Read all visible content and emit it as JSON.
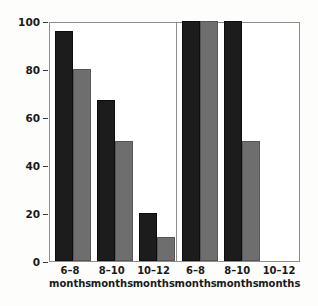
{
  "chart_data": {
    "type": "bar",
    "title": "",
    "subtitle": "",
    "xlabel": "",
    "ylabel": "Infants able to discriminate (%)",
    "ylim": [
      0,
      100
    ],
    "yticks": [
      0,
      20,
      40,
      60,
      80,
      100
    ],
    "ytick_labels": [
      "0",
      "20",
      "40",
      "60",
      "80",
      "100"
    ],
    "grid": false,
    "legend": "none",
    "panels": [
      {
        "name": "left-panel",
        "categories": [
          "6–8 months",
          "8–10 months",
          "10–12 months"
        ],
        "series": [
          {
            "name": "dark-series",
            "color": "#1c1c1c",
            "values": [
              96,
              67,
              20
            ]
          },
          {
            "name": "gray-series",
            "color": "#6e6e6e",
            "values": [
              80,
              50,
              10
            ]
          }
        ]
      },
      {
        "name": "right-panel",
        "categories": [
          "6–8 months",
          "8–10 months",
          "10–12 months"
        ],
        "series": [
          {
            "name": "dark-series",
            "color": "#1c1c1c",
            "values": [
              100,
              100,
              0
            ]
          },
          {
            "name": "gray-series",
            "color": "#6e6e6e",
            "values": [
              100,
              50,
              0
            ]
          }
        ]
      }
    ]
  },
  "axis": {
    "y_title": "Infants able to discriminate (%)",
    "y_tick_labels": [
      "100",
      "80",
      "60",
      "40",
      "20",
      "0"
    ]
  },
  "x_categories": [
    {
      "line1": "6–8",
      "line2": "months"
    },
    {
      "line1": "8–10",
      "line2": "months"
    },
    {
      "line1": "10–12",
      "line2": "months"
    },
    {
      "line1": "6–8",
      "line2": "months"
    },
    {
      "line1": "8–10",
      "line2": "months"
    },
    {
      "line1": "10–12",
      "line2": "months"
    }
  ],
  "colors": {
    "dark_bar": "#1c1c1c",
    "gray_bar": "#6e6e6e",
    "frame": "#8d8d8d",
    "text": "#1a1a1a",
    "background": "#fdfdfb"
  }
}
